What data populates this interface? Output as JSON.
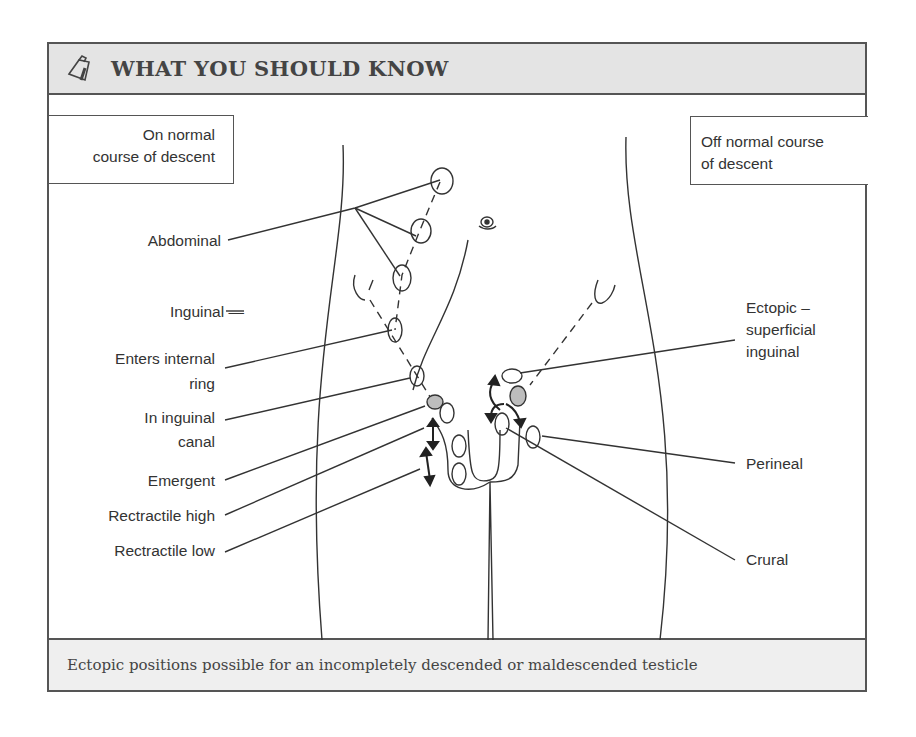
{
  "header": {
    "icon": "clipboard-note-icon",
    "title": "WHAT YOU SHOULD KNOW"
  },
  "legend_boxes": {
    "left": {
      "line1": "On normal",
      "line2": "course of descent"
    },
    "right": {
      "line1": "Off normal course",
      "line2": "of descent"
    }
  },
  "labels_left": {
    "abdominal": "Abdominal",
    "inguinal": "Inguinal —",
    "enters_internal_ring_1": "Enters internal",
    "enters_internal_ring_2": "ring",
    "in_inguinal_canal_1": "In inguinal",
    "in_inguinal_canal_2": "canal",
    "emergent": "Emergent",
    "retractile_high": "Rectractile high",
    "retractile_low": "Rectractile low"
  },
  "labels_right": {
    "ectopic_1": "Ectopic –",
    "ectopic_2": "superficial",
    "ectopic_3": "inguinal",
    "perineal": "Perineal",
    "crural": "Crural"
  },
  "footer": {
    "caption": "Ectopic positions possible for an incompletely descended or maldescended testicle"
  },
  "colors": {
    "line": "#333333",
    "header_bg": "#e4e4e4",
    "footer_bg": "#efefef",
    "shaded_testis": "#bdbdbd"
  }
}
